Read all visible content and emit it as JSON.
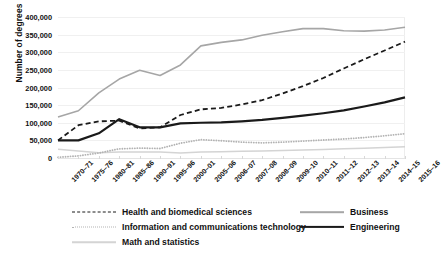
{
  "chart_data": {
    "type": "line",
    "title": "",
    "xlabel": "",
    "ylabel": "Number of degrees",
    "ylim": [
      0,
      400000
    ],
    "ytick_labels": [
      "400,000",
      "350,000",
      "300,000",
      "250,000",
      "200,000",
      "150,000",
      "100,000",
      "50,000",
      "0"
    ],
    "ytick_values": [
      400000,
      350000,
      300000,
      250000,
      200000,
      150000,
      100000,
      50000,
      0
    ],
    "grid": true,
    "legend_position": "bottom",
    "categories": [
      "1970–71",
      "1975–76",
      "1980–81",
      "1985–86",
      "1990–91",
      "1995–96",
      "2000–01",
      "2005–06",
      "2006–07",
      "2007–08",
      "2008–09",
      "2009–10",
      "2010–11",
      "2011–12",
      "2012–13",
      "2013–14",
      "2014–15",
      "2015–16"
    ],
    "series": [
      {
        "name": "Business",
        "color": "#a6a6a6",
        "style": "solid",
        "width": 1.6,
        "values": [
          116000,
          134000,
          185000,
          224000,
          249000,
          234000,
          264000,
          318000,
          328000,
          335000,
          348000,
          358000,
          367000,
          367000,
          361000,
          360000,
          363000,
          371000
        ]
      },
      {
        "name": "Health and biomedical sciences",
        "color": "#1a1a1a",
        "style": "dashed",
        "width": 1.8,
        "values": [
          50000,
          93000,
          104000,
          106000,
          84000,
          87000,
          122000,
          138000,
          142000,
          152000,
          164000,
          183000,
          204000,
          227000,
          254000,
          280000,
          305000,
          330000
        ]
      },
      {
        "name": "Engineering",
        "color": "#1a1a1a",
        "style": "solid",
        "width": 2.2,
        "values": [
          50000,
          50000,
          70000,
          110000,
          87000,
          87000,
          98000,
          100000,
          101000,
          104000,
          108000,
          114000,
          120000,
          127000,
          135000,
          146000,
          158000,
          172000
        ]
      },
      {
        "name": "Information and communications technology",
        "color": "#b3b3b3",
        "style": "dotted",
        "width": 1.8,
        "values": [
          2000,
          6000,
          14000,
          26000,
          28000,
          27000,
          42000,
          52000,
          49000,
          45000,
          43000,
          45000,
          48000,
          51000,
          54000,
          58000,
          63000,
          69000
        ]
      },
      {
        "name": "Math and statistics",
        "color": "#d4d4d4",
        "style": "solid",
        "width": 1.5,
        "values": [
          25000,
          20000,
          15000,
          17000,
          17000,
          17000,
          14000,
          17000,
          18000,
          19000,
          20000,
          21000,
          23000,
          24000,
          26000,
          28000,
          30000,
          32000
        ]
      }
    ]
  },
  "legend": {
    "items": [
      {
        "label": "Health and biomedical sciences",
        "series": "Health and biomedical sciences"
      },
      {
        "label": "Information and communications technology",
        "series": "Information and communications technology"
      },
      {
        "label": "Math and statistics",
        "series": "Math and statistics"
      },
      {
        "label": "Business",
        "series": "Business"
      },
      {
        "label": "Engineering",
        "series": "Engineering"
      }
    ]
  }
}
